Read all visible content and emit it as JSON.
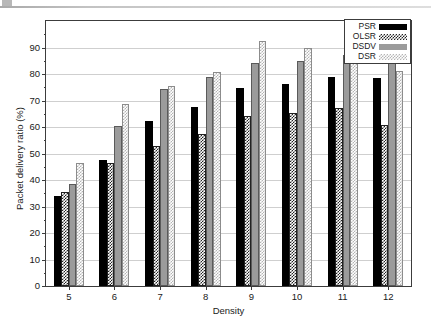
{
  "figure": {
    "background": "#ffffff",
    "frame_color": "#3c3c3c",
    "grid_color": "#cfcfcf"
  },
  "legend": {
    "position": "top-right",
    "entries": [
      {
        "label": "PSR",
        "style": "solid-black",
        "color": "#000000"
      },
      {
        "label": "OLSR",
        "style": "dark-checkerboard",
        "color": "#232323"
      },
      {
        "label": "DSDV",
        "style": "solid-gray",
        "color": "#9b9b9b"
      },
      {
        "label": "DSR",
        "style": "light-checkerboard",
        "color": "#b4b4b4"
      }
    ]
  },
  "chart_data": {
    "type": "bar",
    "title": "",
    "xlabel": "Density",
    "ylabel": "Packet delivery ratio (%)",
    "categories": [
      "5",
      "6",
      "7",
      "8",
      "9",
      "10",
      "11",
      "12"
    ],
    "series": [
      {
        "name": "PSR",
        "values": [
          34.0,
          47.5,
          62.3,
          67.5,
          74.7,
          76.2,
          79.0,
          78.4
        ]
      },
      {
        "name": "OLSR",
        "values": [
          35.5,
          46.5,
          53.0,
          57.2,
          64.0,
          65.3,
          67.0,
          60.7
        ]
      },
      {
        "name": "DSDV",
        "values": [
          38.4,
          60.4,
          74.5,
          78.8,
          84.2,
          84.8,
          87.0,
          86.5
        ]
      },
      {
        "name": "DSR",
        "values": [
          46.3,
          68.5,
          75.5,
          80.6,
          92.4,
          90.0,
          84.2,
          81.1
        ]
      }
    ],
    "yticks": [
      0,
      10,
      20,
      30,
      40,
      50,
      60,
      70,
      80,
      90
    ],
    "ylim": [
      0,
      100
    ],
    "grid": true,
    "legend_position": "top-right"
  }
}
